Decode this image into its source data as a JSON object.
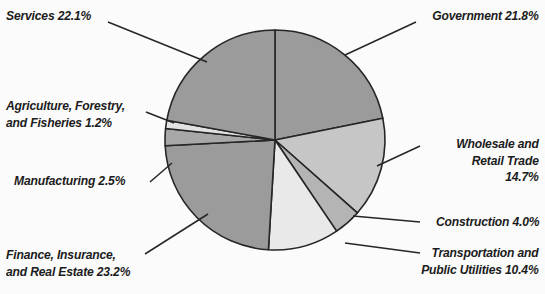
{
  "chart_data": {
    "type": "pie",
    "title": "",
    "units": "percent",
    "total": 100.0,
    "start_angle_deg": 0,
    "direction": "clockwise",
    "center": [
      275,
      140
    ],
    "radius": 110,
    "categories": [
      "Government",
      "Wholesale and Retail Trade",
      "Construction",
      "Transportation and Public Utilities",
      "Finance, Insurance, and Real Estate",
      "Manufacturing",
      "Agriculture, Forestry, and Fisheries",
      "Services"
    ],
    "values": [
      21.8,
      14.7,
      4.0,
      10.4,
      23.2,
      2.5,
      1.2,
      22.1
    ],
    "slices": [
      {
        "key": "government",
        "name": "Government",
        "value": 21.8,
        "label": "Government 21.8%",
        "color": "#9b9b9b",
        "side": "right"
      },
      {
        "key": "wholesale",
        "name": "Wholesale and Retail Trade",
        "value": 14.7,
        "label": "Wholesale and\nRetail Trade\n14.7%",
        "color": "#c6c6c6",
        "side": "right"
      },
      {
        "key": "construction",
        "name": "Construction",
        "value": 4.0,
        "label": "Construction 4.0%",
        "color": "#b4b4b4",
        "side": "right"
      },
      {
        "key": "transportation",
        "name": "Transportation and Public Utilities",
        "value": 10.4,
        "label": "Transportation and\nPublic Utilities 10.4%",
        "color": "#e9e9e9",
        "side": "right"
      },
      {
        "key": "finance",
        "name": "Finance, Insurance, and Real Estate",
        "value": 23.2,
        "label": "Finance, Insurance,\nand Real Estate 23.2%",
        "color": "#9b9b9b",
        "side": "left"
      },
      {
        "key": "manufacturing",
        "name": "Manufacturing",
        "value": 2.5,
        "label": "Manufacturing 2.5%",
        "color": "#a8a8a8",
        "side": "left"
      },
      {
        "key": "agriculture",
        "name": "Agriculture, Forestry, and Fisheries",
        "value": 1.2,
        "label": "Agriculture, Forestry,\nand Fisheries 1.2%",
        "color": "#e2e2e2",
        "side": "left"
      },
      {
        "key": "services",
        "name": "Services",
        "value": 22.1,
        "label": "Services 22.1%",
        "color": "#9b9b9b",
        "side": "left"
      }
    ],
    "style": {
      "background": "#fbfbfb",
      "stroke": "#262626",
      "stroke_width": 1.6,
      "leader_line_color": "#262626",
      "text_color": "#1c1c1c"
    }
  },
  "leaders": {
    "services": {
      "x1": 108,
      "y1": 22,
      "x2": 207,
      "y2": 62
    },
    "agriculture": {
      "x1": 146,
      "y1": 112,
      "x2": 174,
      "y2": 123
    },
    "manufacturing": {
      "x1": 150,
      "y1": 182,
      "x2": 172,
      "y2": 163
    },
    "finance": {
      "x1": 145,
      "y1": 254,
      "x2": 208,
      "y2": 214
    },
    "government": {
      "x1": 416,
      "y1": 22,
      "x2": 345,
      "y2": 55
    },
    "wholesale": {
      "x1": 420,
      "y1": 146,
      "x2": 377,
      "y2": 166
    },
    "construction": {
      "x1": 420,
      "y1": 222,
      "x2": 353,
      "y2": 216
    },
    "transportation": {
      "x1": 420,
      "y1": 253,
      "x2": 345,
      "y2": 243
    }
  }
}
